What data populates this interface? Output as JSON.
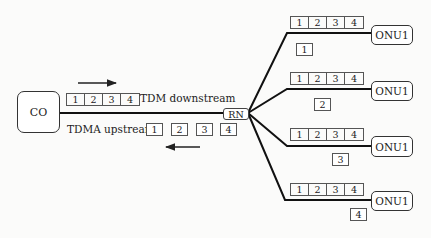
{
  "central_office": {
    "label": "CO"
  },
  "remote_node": {
    "label": "RN"
  },
  "downstream": {
    "label": "TDM downstream",
    "slots": [
      "1",
      "2",
      "3",
      "4"
    ],
    "direction": "right"
  },
  "upstream": {
    "label": "TDMA upstream",
    "slots": [
      "1",
      "2",
      "3",
      "4"
    ],
    "direction": "left"
  },
  "branches": [
    {
      "onu_label": "ONU1",
      "frame_slots": [
        "1",
        "2",
        "3",
        "4"
      ],
      "upstream_slot": "1"
    },
    {
      "onu_label": "ONU1",
      "frame_slots": [
        "1",
        "2",
        "3",
        "4"
      ],
      "upstream_slot": "2"
    },
    {
      "onu_label": "ONU1",
      "frame_slots": [
        "1",
        "2",
        "3",
        "4"
      ],
      "upstream_slot": "3"
    },
    {
      "onu_label": "ONU1",
      "frame_slots": [
        "1",
        "2",
        "3",
        "4"
      ],
      "upstream_slot": "4"
    }
  ],
  "colors": {
    "line": "#111111",
    "box_border": "#555555",
    "background": "#fbfbfa"
  }
}
